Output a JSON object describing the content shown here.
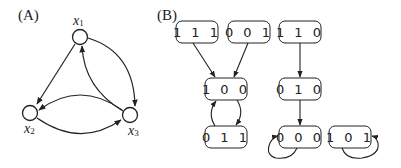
{
  "panel_a": {
    "label": "(A)",
    "nodes": [
      {
        "id": "x1",
        "base": "x",
        "sub": "1"
      },
      {
        "id": "x2",
        "base": "x",
        "sub": "2"
      },
      {
        "id": "x3",
        "base": "x",
        "sub": "3"
      }
    ],
    "edges": [
      {
        "from": "x1",
        "to": "x2"
      },
      {
        "from": "x1",
        "to": "x3"
      },
      {
        "from": "x3",
        "to": "x1"
      },
      {
        "from": "x3",
        "to": "x2"
      },
      {
        "from": "x2",
        "to": "x3"
      }
    ]
  },
  "panel_b": {
    "label": "(B)",
    "states": {
      "s111": "1 1 1",
      "s001": "0 0 1",
      "s110": "1 1 0",
      "s100": "1 0 0",
      "s010": "0 1 0",
      "s011": "0 1 1",
      "s000": "0 0 0",
      "s101": "1 0 1"
    },
    "transitions": [
      {
        "from": "111",
        "to": "100"
      },
      {
        "from": "001",
        "to": "100"
      },
      {
        "from": "100",
        "to": "011"
      },
      {
        "from": "011",
        "to": "100"
      },
      {
        "from": "110",
        "to": "010"
      },
      {
        "from": "010",
        "to": "000"
      },
      {
        "from": "000",
        "to": "000"
      },
      {
        "from": "101",
        "to": "101"
      }
    ]
  },
  "colors": {
    "stroke": "#222222",
    "background": "#ffffff"
  }
}
